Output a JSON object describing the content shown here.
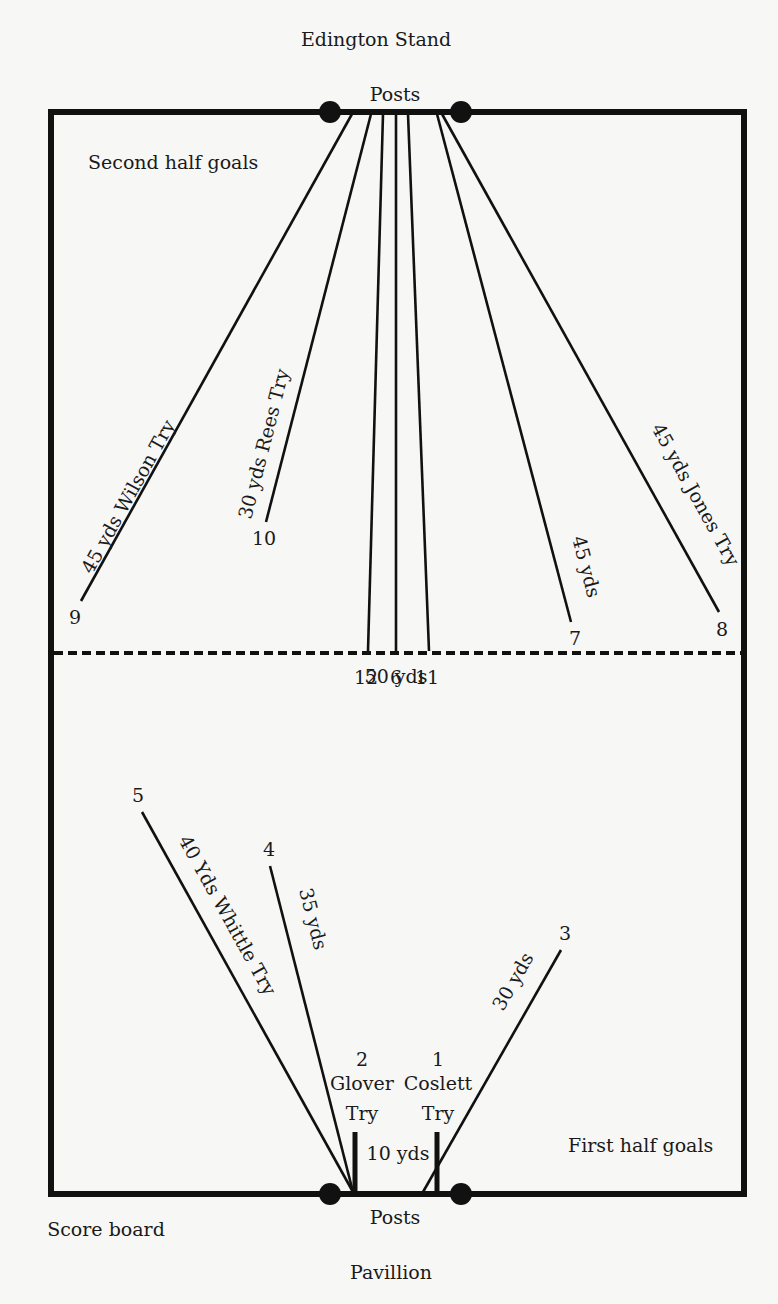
{
  "labels": {
    "top_stand": "Edington Stand",
    "top_posts": "Posts",
    "bottom_posts": "Posts",
    "bottom_stand": "Pavillion",
    "score_board": "Score board",
    "second_half": "Second half goals",
    "first_half": "First half goals",
    "halfway": "50 yds"
  },
  "second_half_kicks": [
    {
      "num": "9",
      "label": "45 yds Wilson Try"
    },
    {
      "num": "10",
      "label": "30 yds Rees Try"
    },
    {
      "num": "12",
      "label": ""
    },
    {
      "num": "6",
      "label": ""
    },
    {
      "num": "11",
      "label": ""
    },
    {
      "num": "7",
      "label": "45 yds"
    },
    {
      "num": "8",
      "label": "45 yds Jones Try"
    }
  ],
  "first_half_kicks": [
    {
      "num": "5",
      "label": "40 Yds Whittle Try"
    },
    {
      "num": "4",
      "label": "35 yds"
    },
    {
      "num": "3",
      "label": "30 yds"
    },
    {
      "num": "2",
      "label": "Glover",
      "label2": "Try"
    },
    {
      "num": "1",
      "label": "Coslett",
      "label2": "Try"
    }
  ],
  "try_gap_label": "10 yds",
  "colors": {
    "ink": "#111111",
    "paper": "#f7f7f6"
  }
}
